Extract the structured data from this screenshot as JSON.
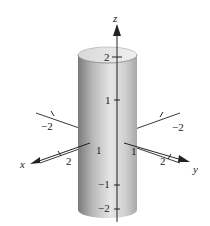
{
  "figure": {
    "type": "3d-surface-plot",
    "surface": "cylinder",
    "axes": {
      "x": {
        "label": "x",
        "ticks": [
          "-2",
          "1",
          "2"
        ]
      },
      "y": {
        "label": "y",
        "ticks": [
          "-2",
          "1",
          "2"
        ]
      },
      "z": {
        "label": "z",
        "ticks": [
          "2",
          "1",
          "-1",
          "-2"
        ]
      }
    },
    "labels": {
      "x_axis": "x",
      "y_axis": "y",
      "z_axis": "z",
      "z_2": "2",
      "z_1": "1",
      "z_m1": "−1",
      "z_m2": "−2",
      "x_m2": "−2",
      "x_1": "1",
      "x_2": "2",
      "y_m2": "−2",
      "y_1": "1",
      "y_2": "2"
    },
    "colors": {
      "surface_light": "#e4e4e4",
      "surface_dark": "#8a8a8a",
      "axis": "#222222"
    }
  }
}
